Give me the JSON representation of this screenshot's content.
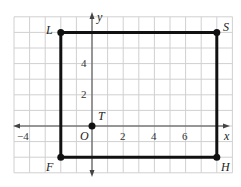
{
  "diagram": {
    "type": "coordinate-grid",
    "grid": {
      "x_min": -5,
      "x_max": 9,
      "y_min": -3,
      "y_max": 7,
      "unit_px": 15.6,
      "origin_px": [
        92,
        126
      ],
      "grid_color": "#d0d0d0"
    },
    "axes": {
      "x_label": "x",
      "y_label": "y",
      "origin_label": "O"
    },
    "x_ticks": [
      {
        "value": -4,
        "label": "−4"
      },
      {
        "value": 2,
        "label": "2"
      },
      {
        "value": 4,
        "label": "4"
      },
      {
        "value": 6,
        "label": "6"
      }
    ],
    "y_ticks": [
      {
        "value": 2,
        "label": "2"
      },
      {
        "value": 4,
        "label": "4"
      }
    ],
    "points": [
      {
        "name": "L",
        "x": -2,
        "y": 6
      },
      {
        "name": "S",
        "x": 8,
        "y": 6
      },
      {
        "name": "H",
        "x": 8,
        "y": -2
      },
      {
        "name": "F",
        "x": -2,
        "y": -2
      },
      {
        "name": "T",
        "x": 0,
        "y": 0
      }
    ],
    "rectangle": [
      "L",
      "S",
      "H",
      "F"
    ],
    "line_color": "#111111"
  }
}
